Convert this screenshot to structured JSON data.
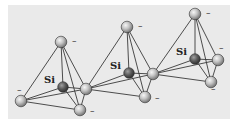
{
  "figure": {
    "colors": {
      "background": "#eaeaea",
      "oxygen": "#b9b9b9",
      "oxygen_highlight": "#f4f4f4",
      "silicon": "#5d5d5d",
      "silicon_highlight": "#a8a8a8",
      "bond": "#3a3a3a"
    },
    "silicon_label": "Si",
    "charge_label": "–",
    "tetrahedra": [
      {
        "name": "tetrahedron-1",
        "silicon_label": "Si"
      },
      {
        "name": "tetrahedron-2",
        "silicon_label": "Si"
      },
      {
        "name": "tetrahedron-3",
        "silicon_label": "Si"
      }
    ]
  }
}
